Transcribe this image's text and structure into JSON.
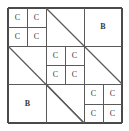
{
  "figure": {
    "background_color": "#ffffff",
    "line_color": "#5a5a5a",
    "outer_line_color": "#4a4a4a",
    "text_color": "#3a3a3a",
    "frame": {
      "x": 8,
      "y": 8,
      "width": 114,
      "height": 115
    },
    "labels": {
      "c": "C",
      "b": "B"
    },
    "cells": [
      {
        "id": "c-l1-tl-1",
        "label": "C",
        "kind": "c",
        "x": 8,
        "y": 8,
        "w": 19,
        "h": 19
      },
      {
        "id": "c-l1-tl-2",
        "label": "C",
        "kind": "c",
        "x": 27,
        "y": 8,
        "w": 19,
        "h": 19
      },
      {
        "id": "c-l1-tl-3",
        "label": "C",
        "kind": "c",
        "x": 8,
        "y": 27,
        "w": 19,
        "h": 19
      },
      {
        "id": "c-l1-tl-4",
        "label": "C",
        "kind": "c",
        "x": 27,
        "y": 27,
        "w": 19,
        "h": 19
      },
      {
        "id": "b-l1-tr",
        "label": "B",
        "kind": "b",
        "x": 84,
        "y": 8,
        "w": 38,
        "h": 38
      },
      {
        "id": "c-l2-c-1",
        "label": "C",
        "kind": "c",
        "x": 46,
        "y": 46,
        "w": 19,
        "h": 19
      },
      {
        "id": "c-l2-c-2",
        "label": "C",
        "kind": "c",
        "x": 65,
        "y": 46,
        "w": 19,
        "h": 19
      },
      {
        "id": "c-l2-c-3",
        "label": "C",
        "kind": "c",
        "x": 46,
        "y": 65,
        "w": 19,
        "h": 19
      },
      {
        "id": "c-l2-c-4",
        "label": "C",
        "kind": "c",
        "x": 65,
        "y": 65,
        "w": 19,
        "h": 19
      },
      {
        "id": "b-l2-bl",
        "label": "B",
        "kind": "b",
        "x": 8,
        "y": 84,
        "w": 39,
        "h": 39
      },
      {
        "id": "c-l3-br-1",
        "label": "C",
        "kind": "c",
        "x": 84,
        "y": 84,
        "w": 19,
        "h": 19
      },
      {
        "id": "c-l3-br-2",
        "label": "C",
        "kind": "c",
        "x": 103,
        "y": 84,
        "w": 19,
        "h": 19
      },
      {
        "id": "c-l3-br-3",
        "label": "C",
        "kind": "c",
        "x": 84,
        "y": 104,
        "w": 19,
        "h": 19
      },
      {
        "id": "c-l3-br-4",
        "label": "C",
        "kind": "c",
        "x": 103,
        "y": 104,
        "w": 19,
        "h": 19
      }
    ],
    "segments": [
      {
        "id": "frame-top",
        "kind": "outer",
        "x1": 8,
        "y1": 8,
        "x2": 122,
        "y2": 8
      },
      {
        "id": "frame-right",
        "kind": "outer",
        "x1": 122,
        "y1": 8,
        "x2": 122,
        "y2": 123
      },
      {
        "id": "frame-bottom",
        "kind": "outer",
        "x1": 8,
        "y1": 123,
        "x2": 122,
        "y2": 123
      },
      {
        "id": "frame-left",
        "kind": "outer",
        "x1": 8,
        "y1": 8,
        "x2": 8,
        "y2": 123
      },
      {
        "id": "h-level1",
        "kind": "inner",
        "x1": 8,
        "y1": 46,
        "x2": 122,
        "y2": 46
      },
      {
        "id": "h-level2",
        "kind": "inner",
        "x1": 8,
        "y1": 84,
        "x2": 122,
        "y2": 84
      },
      {
        "id": "v-level1",
        "kind": "inner",
        "x1": 46,
        "y1": 8,
        "x2": 46,
        "y2": 123
      },
      {
        "id": "v-level2",
        "kind": "inner",
        "x1": 84,
        "y1": 8,
        "x2": 84,
        "y2": 123
      },
      {
        "id": "h-tl-split",
        "kind": "inner",
        "x1": 8,
        "y1": 27,
        "x2": 46,
        "y2": 27
      },
      {
        "id": "v-tl-split",
        "kind": "inner",
        "x1": 27,
        "y1": 8,
        "x2": 27,
        "y2": 46
      },
      {
        "id": "h-ctr-split",
        "kind": "inner",
        "x1": 46,
        "y1": 65,
        "x2": 84,
        "y2": 65
      },
      {
        "id": "v-ctr-split",
        "kind": "inner",
        "x1": 65,
        "y1": 46,
        "x2": 65,
        "y2": 84
      },
      {
        "id": "h-br-split",
        "kind": "inner",
        "x1": 84,
        "y1": 104,
        "x2": 122,
        "y2": 104
      },
      {
        "id": "v-br-split",
        "kind": "inner",
        "x1": 103,
        "y1": 84,
        "x2": 103,
        "y2": 123
      },
      {
        "id": "diag-level1",
        "kind": "diagonal",
        "x1": 46,
        "y1": 8,
        "x2": 122,
        "y2": 84
      },
      {
        "id": "diag-level2",
        "kind": "diagonal",
        "x1": 8,
        "y1": 46,
        "x2": 84,
        "y2": 123
      },
      {
        "id": "diag-level3",
        "kind": "diagonal",
        "x1": 46,
        "y1": 84,
        "x2": 84,
        "y2": 123
      }
    ]
  }
}
